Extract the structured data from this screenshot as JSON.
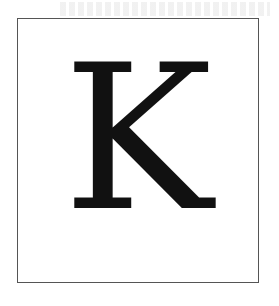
{
  "card": {
    "letter": "K",
    "frame_color": "#555555",
    "letter_color": "#111111",
    "background": "#ffffff"
  }
}
